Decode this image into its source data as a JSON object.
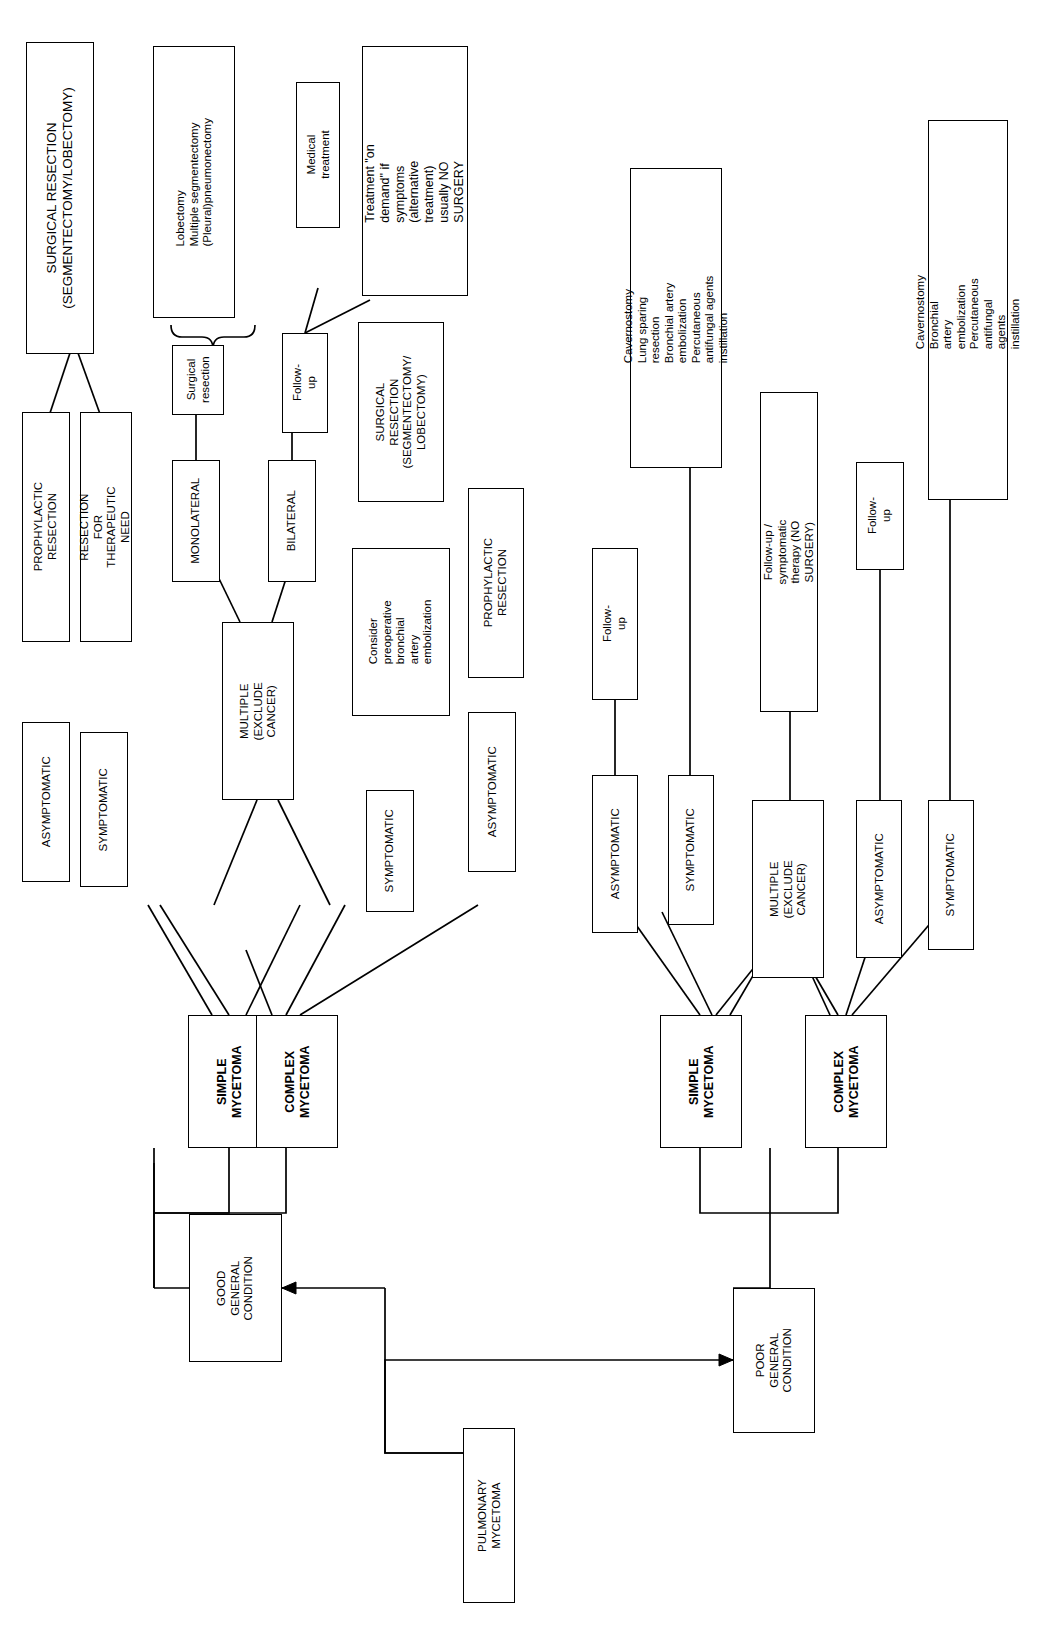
{
  "diagram": {
    "orientation": "rotated-90-ccw",
    "line_color": "#000000",
    "background": "#ffffff"
  },
  "nodes": {
    "root": "PULMONARY\nMYCETOMA",
    "good_condition": "GOOD\nGENERAL\nCONDITION",
    "poor_condition": "POOR\nGENERAL\nCONDITION",
    "left_simple_mycetoma": "SIMPLE\nMYCETOMA",
    "left_complex_mycetoma": "COMPLEX\nMYCETOMA",
    "left_asymptomatic_1": "ASYMPTOMATIC",
    "left_symptomatic_1": "SYMPTOMATIC",
    "left_multiple": "MULTIPLE\n(EXCLUDE\nCANCER)",
    "left_symptomatic_2": "SYMPTOMATIC",
    "left_asymptomatic_2": "ASYMPTOMATIC",
    "prophylactic_resection_1": "PROPHYLACTIC RESECTION",
    "resection_therapeutic_need": "RESECTION FOR\nTHERAPEUTIC NEED",
    "surgical_resection_seg_lob": "SURGICAL RESECTION\n(SEGMENTECTOMY/LOBECTOMY)",
    "monolateral": "MONOLATERAL",
    "bilateral": "BILATERAL",
    "surgical_resection_2": "Surgical\nresection",
    "lobectomy_list": "Lobectomy\nMultiple segmentectomy\n(Pleural)pneumonectomy",
    "follow_up_left": "Follow-up",
    "medical_treatment": "Medical treatment",
    "treatment_on_demand": "Treatment \"on\ndemand\" if symptoms\n(alternative treatment)\nusually NO SURGERY",
    "consider_preop_embolization": "Consider\npreoperative\nbronchial\nartery\nembolization",
    "surgical_resection_seg_lob_2": "SURGICAL\nRESECTION\n(SEGMENTECTOMY/\nLOBECTOMY)",
    "prophylactic_resection_2": "PROPHYLACTIC\nRESECTION",
    "right_simple_mycetoma": "SIMPLE\nMYCETOMA",
    "right_complex_mycetoma": "COMPLEX\nMYCETOMA",
    "right_asymptomatic_1": "ASYMPTOMATIC",
    "right_symptomatic_1": "SYMPTOMATIC",
    "right_multiple": "MULTIPLE\n(EXCLUDE\nCANCER)",
    "right_asymptomatic_2": "ASYMPTOMATIC",
    "right_symptomatic_2": "SYMPTOMATIC",
    "follow_up_right_1": "Follow-up",
    "cavernostomy_list_1": "Cavernostomy\nLung sparing resection\nBronchial artery embolization\nPercutaneous  antifungal agents instillation",
    "follow_up_symptomatic_therapy": "Follow-up / symptomatic therapy (NO SURGERY)",
    "follow_up_right_2": "Follow-up",
    "cavernostomy_list_2": "Cavernostomy\nBronchial artery embolization\nPercutaneous  antifungal agents instillation"
  }
}
